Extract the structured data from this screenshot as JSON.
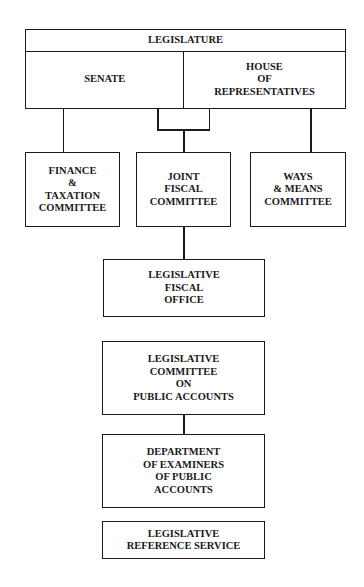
{
  "diagram": {
    "type": "organization-chart",
    "nodes": {
      "legislature": "LEGISLATURE",
      "senate": "SENATE",
      "house": "HOUSE\nOF\nREPRESENTATIVES",
      "finance": "FINANCE\n&\nTAXATION\nCOMMITTEE",
      "joint": "JOINT\nFISCAL\nCOMMITTEE",
      "ways": "WAYS\n& MEANS\nCOMMITTEE",
      "fiscal_office": "LEGISLATIVE\nFISCAL\nOFFICE",
      "public_accounts": "LEGISLATIVE\nCOMMITTEE\nON\nPUBLIC ACCOUNTS",
      "examiners": "DEPARTMENT\nOF EXAMINERS\nOF PUBLIC\nACCOUNTS",
      "reference": "LEGISLATIVE\nREFERENCE SERVICE"
    },
    "edges": [
      [
        "senate",
        "finance"
      ],
      [
        "senate",
        "joint"
      ],
      [
        "house",
        "joint"
      ],
      [
        "house",
        "ways"
      ],
      [
        "joint",
        "fiscal_office"
      ],
      [
        "public_accounts",
        "examiners"
      ]
    ]
  }
}
